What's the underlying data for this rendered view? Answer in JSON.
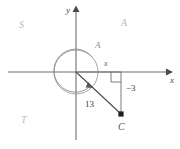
{
  "figure": {
    "background_color": "#ffffff",
    "axis_color": "#6e6e6e",
    "curve_color": "#8f8f8f",
    "ray_color": "#4a4a4a",
    "faint_label_color": "#bdbdbd"
  },
  "axes": {
    "x_label": "x",
    "y_label": "y",
    "origin_x": 76,
    "origin_y": 72
  },
  "labels": {
    "quadrant_upper_left": "S",
    "quadrant_upper_right": "A",
    "quadrant_lower_left": "T",
    "circle_arc_label": "A",
    "segment_x_label": "x",
    "segment_minus_three": "−3",
    "radius_length": "13",
    "point_c": "C"
  },
  "geometry": {
    "circle_radius": 22,
    "point_c_x": 121,
    "point_c_y": 114,
    "right_angle_marker": true,
    "angle_arc_direction": "clockwise-sweep-to-ray"
  }
}
